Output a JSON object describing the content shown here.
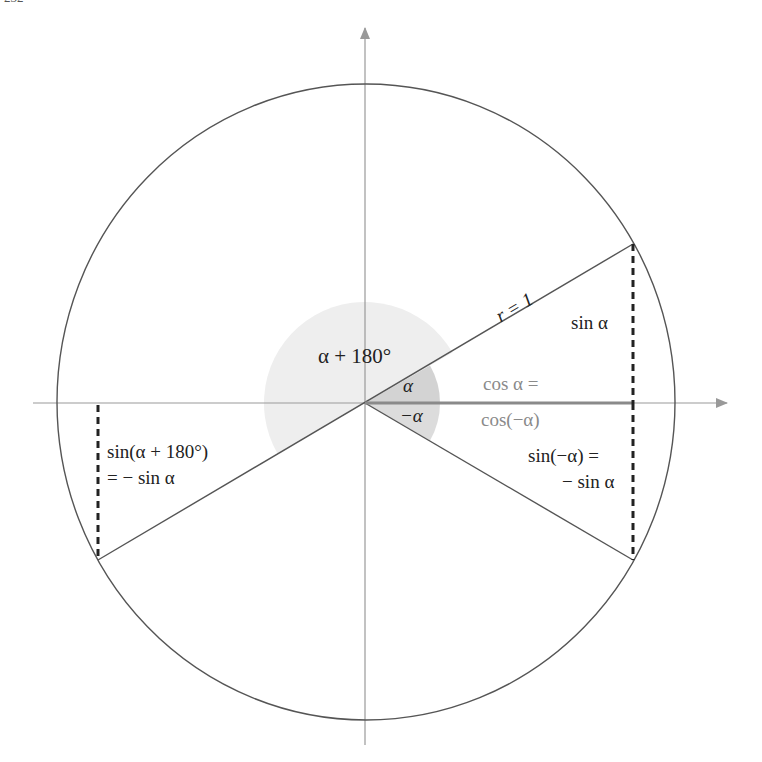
{
  "page_number": "232",
  "diagram": {
    "labels": {
      "alpha_plus_180": "α + 180°",
      "alpha": "α",
      "minus_alpha": "−α",
      "radius": "r = 1",
      "sin_alpha": "sin α",
      "cos_alpha_line1": "cos α =",
      "cos_alpha_line2": "cos(−α)",
      "sin_minus_alpha_line1": "sin(−α) =",
      "sin_minus_alpha_line2": "− sin α",
      "sin_alpha_180_line1": "sin(α + 180°)",
      "sin_alpha_180_line2": "= − sin α"
    },
    "colors": {
      "line": "#555555",
      "axis": "#999999",
      "dashed": "#222222",
      "cos_segment": "#8a8a8a",
      "disk_light": "#eeeeee",
      "wedge_dark": "#cfcfcf"
    },
    "angle_alpha_deg": 30
  }
}
